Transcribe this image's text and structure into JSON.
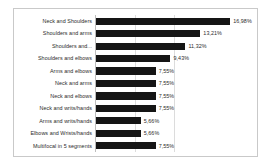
{
  "chart_data": {
    "type": "bar",
    "orientation": "horizontal",
    "title": "",
    "subtitle": "",
    "xlabel": "",
    "ylabel": "",
    "xlim": [
      0,
      20
    ],
    "grid": true,
    "gridlines": [
      5,
      10
    ],
    "legend": "none",
    "value_suffix": "%",
    "decimal_separator": ",",
    "bar_color": "#151515",
    "plot_background": "#ffffff",
    "frame_color": "#c9c9c9",
    "gridline_color": "#dcdcdc",
    "axis_color": "#bdbdbd",
    "categories": [
      "Neck and Shoulders",
      "Shoulders and arms",
      "Shoulders and...",
      "Shoulders and elbows",
      "Arms and elbows",
      "Neck and arms",
      "Neck and elbows",
      "Neck and writs/hands",
      "Arms and writs/hands",
      "Elbows and Wrists/hands",
      "Multifocal in 5 segments"
    ],
    "values": [
      16.98,
      13.21,
      11.32,
      9.43,
      7.55,
      7.55,
      7.55,
      7.55,
      5.66,
      5.66,
      7.55
    ],
    "value_labels": [
      "16,98%",
      "13,21%",
      "11,32%",
      "9,43%",
      "7,55%",
      "7,55%",
      "7,55%",
      "7,55%",
      "5,66%",
      "5,66%",
      "7,55%"
    ]
  }
}
